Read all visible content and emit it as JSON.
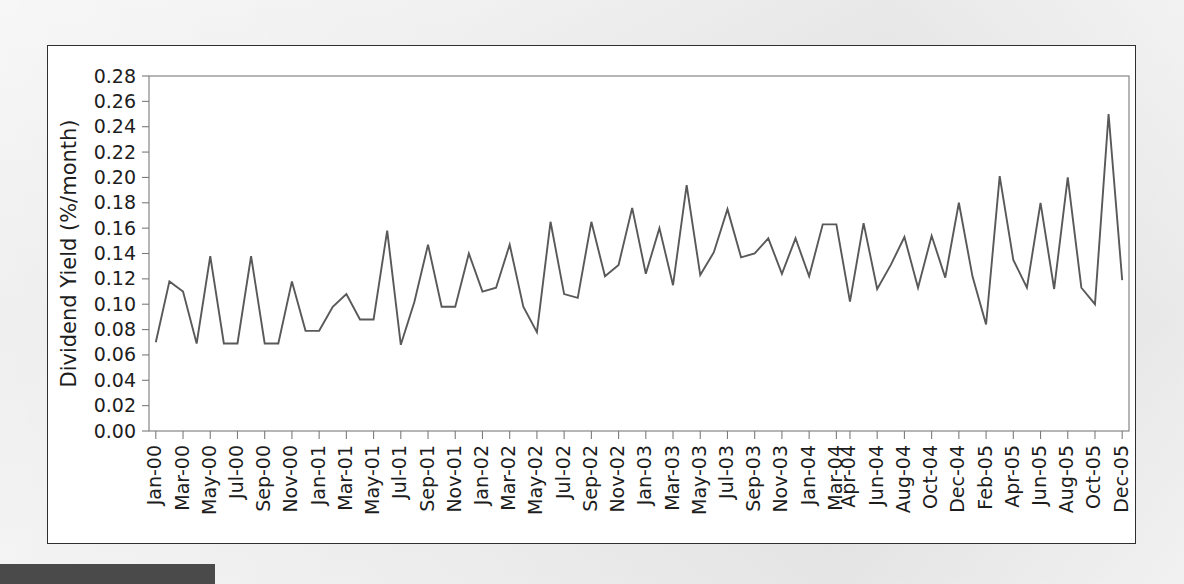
{
  "page": {
    "background_color": "#e8e8e8",
    "figure_background": "#ffffff",
    "footer_bar_color": "#4a4a4a"
  },
  "chart_data": {
    "type": "line",
    "title": "",
    "xlabel": "",
    "ylabel": "Dividend Yield (%/month)",
    "ylim": [
      0.0,
      0.28
    ],
    "ytick_step": 0.02,
    "ytick_labels": [
      "0.00",
      "0.02",
      "0.04",
      "0.06",
      "0.08",
      "0.10",
      "0.12",
      "0.14",
      "0.16",
      "0.18",
      "0.20",
      "0.22",
      "0.24",
      "0.26",
      "0.28"
    ],
    "ytick_values": [
      0.0,
      0.02,
      0.04,
      0.06,
      0.08,
      0.1,
      0.12,
      0.14,
      0.16,
      0.18,
      0.2,
      0.22,
      0.24,
      0.26,
      0.28
    ],
    "grid": false,
    "legend": null,
    "line_color": "#595959",
    "axis_color": "#7b7b7b",
    "xtick_labels": [
      "Jan-00",
      "Mar-00",
      "May-00",
      "Jul-00",
      "Sep-00",
      "Nov-00",
      "Jan-01",
      "Mar-01",
      "May-01",
      "Jul-01",
      "Sep-01",
      "Nov-01",
      "Jan-02",
      "Mar-02",
      "May-02",
      "Jul-02",
      "Sep-02",
      "Nov-02",
      "Jan-03",
      "Mar-03",
      "May-03",
      "Jul-03",
      "Sep-03",
      "Nov-03",
      "Jan-04",
      "Mar-04",
      "Apr-04",
      "Jun-04",
      "Aug-04",
      "Oct-04",
      "Dec-04",
      "Feb-05",
      "Apr-05",
      "Jun-05",
      "Aug-05",
      "Oct-05",
      "Dec-05"
    ],
    "xtick_indices": [
      0,
      2,
      4,
      6,
      8,
      10,
      12,
      14,
      16,
      18,
      20,
      22,
      24,
      26,
      28,
      30,
      32,
      34,
      36,
      38,
      40,
      42,
      44,
      46,
      48,
      50,
      51,
      53,
      55,
      57,
      59,
      61,
      63,
      65,
      67,
      69,
      71
    ],
    "x": [
      "Jan-00",
      "Feb-00",
      "Mar-00",
      "Apr-00",
      "May-00",
      "Jun-00",
      "Jul-00",
      "Aug-00",
      "Sep-00",
      "Oct-00",
      "Nov-00",
      "Dec-00",
      "Jan-01",
      "Feb-01",
      "Mar-01",
      "Apr-01",
      "May-01",
      "Jun-01",
      "Jul-01",
      "Aug-01",
      "Sep-01",
      "Oct-01",
      "Nov-01",
      "Dec-01",
      "Jan-02",
      "Feb-02",
      "Mar-02",
      "Apr-02",
      "May-02",
      "Jun-02",
      "Jul-02",
      "Aug-02",
      "Sep-02",
      "Oct-02",
      "Nov-02",
      "Dec-02",
      "Jan-03",
      "Feb-03",
      "Mar-03",
      "Apr-03",
      "May-03",
      "Jun-03",
      "Jul-03",
      "Aug-03",
      "Sep-03",
      "Oct-03",
      "Nov-03",
      "Dec-03",
      "Jan-04",
      "Feb-04",
      "Mar-04",
      "Apr-04",
      "May-04",
      "Jun-04",
      "Jul-04",
      "Aug-04",
      "Sep-04",
      "Oct-04",
      "Nov-04",
      "Dec-04",
      "Jan-05",
      "Feb-05",
      "Mar-05",
      "Apr-05",
      "May-05",
      "Jun-05",
      "Jul-05",
      "Aug-05",
      "Sep-05",
      "Oct-05",
      "Nov-05",
      "Dec-05"
    ],
    "values": [
      0.07,
      0.118,
      0.11,
      0.069,
      0.138,
      0.069,
      0.069,
      0.138,
      0.069,
      0.069,
      0.118,
      0.079,
      0.079,
      0.098,
      0.108,
      0.088,
      0.088,
      0.158,
      0.068,
      0.102,
      0.147,
      0.098,
      0.098,
      0.14,
      0.11,
      0.113,
      0.147,
      0.098,
      0.078,
      0.165,
      0.108,
      0.105,
      0.165,
      0.122,
      0.131,
      0.176,
      0.124,
      0.16,
      0.115,
      0.194,
      0.123,
      0.141,
      0.175,
      0.137,
      0.14,
      0.152,
      0.124,
      0.152,
      0.122,
      0.163,
      0.163,
      0.102,
      0.164,
      0.112,
      0.131,
      0.153,
      0.113,
      0.154,
      0.121,
      0.18,
      0.122,
      0.084,
      0.201,
      0.135,
      0.113,
      0.18,
      0.112,
      0.2,
      0.113,
      0.1,
      0.25,
      0.119
    ]
  }
}
